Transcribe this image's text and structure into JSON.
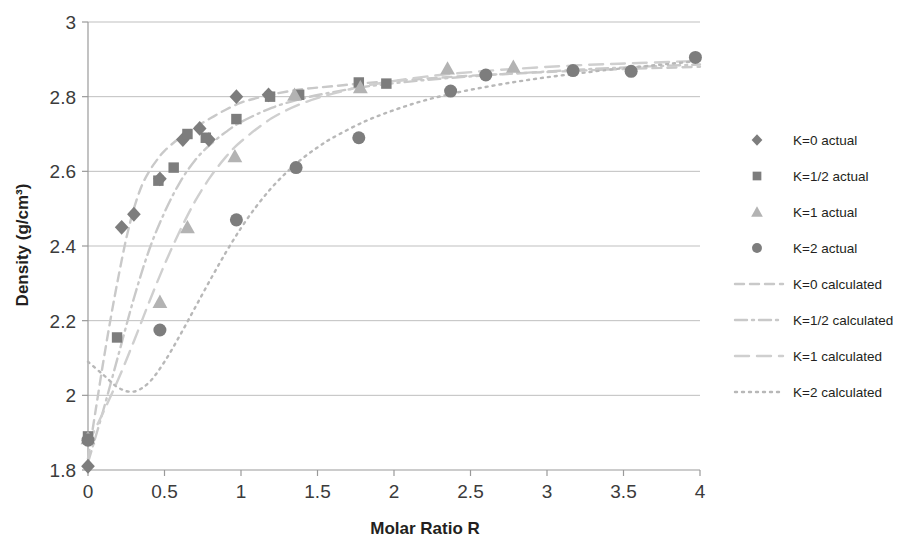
{
  "chart_data": {
    "type": "scatter",
    "title": "",
    "xlabel": "Molar Ratio R",
    "ylabel": "Density (g/cm³)",
    "xlim": [
      0,
      4
    ],
    "ylim": [
      1.8,
      3
    ],
    "xticks": [
      "0",
      "0.5",
      "1",
      "1.5",
      "2",
      "2.5",
      "3",
      "3.5",
      "4"
    ],
    "xtick_values": [
      0,
      0.5,
      1,
      1.5,
      2,
      2.5,
      3,
      3.5,
      4
    ],
    "yticks": [
      "1.8",
      "2",
      "2.2",
      "2.4",
      "2.6",
      "2.8",
      "3"
    ],
    "ytick_values": [
      1.8,
      2.0,
      2.2,
      2.4,
      2.6,
      2.8,
      3.0
    ],
    "grid": "horizontal",
    "legend_position": "right",
    "marker_color": "#7d7d7d",
    "marker_color_light": "#b3b3b3",
    "line_color": "#c9c9c9",
    "axis_color": "#9a9a9a",
    "series": [
      {
        "name": "K=0 actual",
        "marker": "diamond",
        "color": "#7d7d7d",
        "points": [
          [
            0.0,
            1.81
          ],
          [
            0.22,
            2.45
          ],
          [
            0.3,
            2.485
          ],
          [
            0.47,
            2.58
          ],
          [
            0.62,
            2.685
          ],
          [
            0.73,
            2.715
          ],
          [
            0.79,
            2.685
          ],
          [
            0.97,
            2.8
          ],
          [
            1.18,
            2.805
          ]
        ]
      },
      {
        "name": "K=1/2 actual",
        "marker": "square",
        "color": "#7d7d7d",
        "points": [
          [
            0.0,
            1.89
          ],
          [
            0.19,
            2.155
          ],
          [
            0.46,
            2.575
          ],
          [
            0.56,
            2.61
          ],
          [
            0.65,
            2.7
          ],
          [
            0.77,
            2.69
          ],
          [
            0.97,
            2.74
          ],
          [
            1.19,
            2.8
          ],
          [
            1.38,
            2.805
          ],
          [
            1.77,
            2.838
          ],
          [
            1.95,
            2.835
          ]
        ]
      },
      {
        "name": "K=1 actual",
        "marker": "triangle",
        "color": "#b3b3b3",
        "points": [
          [
            0.0,
            1.885
          ],
          [
            0.47,
            2.25
          ],
          [
            0.65,
            2.45
          ],
          [
            0.96,
            2.64
          ],
          [
            1.35,
            2.805
          ],
          [
            1.78,
            2.825
          ],
          [
            2.35,
            2.875
          ],
          [
            2.78,
            2.88
          ]
        ]
      },
      {
        "name": "K=2 actual",
        "marker": "circle",
        "color": "#7d7d7d",
        "points": [
          [
            0.0,
            1.88
          ],
          [
            0.47,
            2.175
          ],
          [
            0.97,
            2.47
          ],
          [
            1.36,
            2.61
          ],
          [
            1.77,
            2.69
          ],
          [
            2.37,
            2.815
          ],
          [
            2.6,
            2.858
          ],
          [
            3.17,
            2.87
          ],
          [
            3.55,
            2.868
          ],
          [
            3.97,
            2.905
          ]
        ]
      }
    ],
    "curves": [
      {
        "name": "K=0 calculated",
        "dash": "dashed",
        "color": "#c9c9c9",
        "points": [
          [
            0.0,
            1.83
          ],
          [
            0.05,
            1.96
          ],
          [
            0.1,
            2.09
          ],
          [
            0.15,
            2.21
          ],
          [
            0.2,
            2.32
          ],
          [
            0.25,
            2.42
          ],
          [
            0.3,
            2.5
          ],
          [
            0.35,
            2.56
          ],
          [
            0.4,
            2.6
          ],
          [
            0.45,
            2.63
          ],
          [
            0.5,
            2.655
          ],
          [
            0.6,
            2.69
          ],
          [
            0.7,
            2.718
          ],
          [
            0.8,
            2.742
          ],
          [
            0.9,
            2.765
          ],
          [
            1.0,
            2.784
          ],
          [
            1.1,
            2.796
          ],
          [
            1.2,
            2.806
          ],
          [
            1.4,
            2.82
          ],
          [
            1.6,
            2.828
          ],
          [
            1.8,
            2.836
          ],
          [
            2.0,
            2.842
          ],
          [
            2.2,
            2.848
          ],
          [
            2.5,
            2.856
          ],
          [
            3.0,
            2.866
          ],
          [
            3.5,
            2.874
          ],
          [
            4.0,
            2.88
          ]
        ]
      },
      {
        "name": "K=1/2 calculated",
        "dash": "dashdot",
        "color": "#c9c9c9",
        "points": [
          [
            0.0,
            1.82
          ],
          [
            0.1,
            1.96
          ],
          [
            0.2,
            2.11
          ],
          [
            0.3,
            2.26
          ],
          [
            0.4,
            2.39
          ],
          [
            0.5,
            2.49
          ],
          [
            0.6,
            2.57
          ],
          [
            0.7,
            2.63
          ],
          [
            0.8,
            2.672
          ],
          [
            0.9,
            2.705
          ],
          [
            1.0,
            2.732
          ],
          [
            1.2,
            2.77
          ],
          [
            1.4,
            2.795
          ],
          [
            1.6,
            2.812
          ],
          [
            1.8,
            2.826
          ],
          [
            2.0,
            2.836
          ],
          [
            2.3,
            2.848
          ],
          [
            2.7,
            2.86
          ],
          [
            3.2,
            2.872
          ],
          [
            3.6,
            2.88
          ],
          [
            4.0,
            2.886
          ]
        ]
      },
      {
        "name": "K=1 calculated",
        "dash": "longdash",
        "color": "#cfcfcf",
        "points": [
          [
            0.0,
            1.87
          ],
          [
            0.1,
            1.955
          ],
          [
            0.2,
            2.045
          ],
          [
            0.3,
            2.145
          ],
          [
            0.4,
            2.25
          ],
          [
            0.5,
            2.35
          ],
          [
            0.6,
            2.44
          ],
          [
            0.7,
            2.52
          ],
          [
            0.8,
            2.585
          ],
          [
            0.9,
            2.638
          ],
          [
            1.0,
            2.68
          ],
          [
            1.2,
            2.742
          ],
          [
            1.4,
            2.782
          ],
          [
            1.6,
            2.808
          ],
          [
            1.8,
            2.828
          ],
          [
            2.0,
            2.842
          ],
          [
            2.3,
            2.858
          ],
          [
            2.7,
            2.872
          ],
          [
            3.2,
            2.884
          ],
          [
            3.6,
            2.89
          ],
          [
            4.0,
            2.896
          ]
        ]
      },
      {
        "name": "K=2 calculated",
        "dash": "dotted",
        "color": "#b8b8b8",
        "points": [
          [
            0.0,
            2.09
          ],
          [
            0.1,
            2.055
          ],
          [
            0.2,
            2.02
          ],
          [
            0.3,
            2.01
          ],
          [
            0.4,
            2.035
          ],
          [
            0.5,
            2.09
          ],
          [
            0.6,
            2.16
          ],
          [
            0.7,
            2.235
          ],
          [
            0.8,
            2.31
          ],
          [
            0.9,
            2.382
          ],
          [
            1.0,
            2.448
          ],
          [
            1.1,
            2.506
          ],
          [
            1.2,
            2.556
          ],
          [
            1.3,
            2.598
          ],
          [
            1.4,
            2.634
          ],
          [
            1.5,
            2.664
          ],
          [
            1.6,
            2.69
          ],
          [
            1.8,
            2.732
          ],
          [
            2.0,
            2.764
          ],
          [
            2.2,
            2.79
          ],
          [
            2.4,
            2.81
          ],
          [
            2.6,
            2.826
          ],
          [
            2.8,
            2.84
          ],
          [
            3.0,
            2.852
          ],
          [
            3.2,
            2.862
          ],
          [
            3.4,
            2.872
          ],
          [
            3.6,
            2.88
          ],
          [
            3.8,
            2.888
          ],
          [
            4.0,
            2.896
          ]
        ]
      }
    ]
  },
  "legend": {
    "items": [
      {
        "label": "K=0 actual",
        "kind": "marker",
        "marker": "diamond",
        "color": "#7d7d7d"
      },
      {
        "label": "K=1/2 actual",
        "kind": "marker",
        "marker": "square",
        "color": "#7d7d7d"
      },
      {
        "label": "K=1 actual",
        "kind": "marker",
        "marker": "triangle",
        "color": "#b3b3b3"
      },
      {
        "label": "K=2 actual",
        "kind": "marker",
        "marker": "circle",
        "color": "#7d7d7d"
      },
      {
        "label": "K=0 calculated",
        "kind": "line",
        "dash": "dashed",
        "color": "#c9c9c9"
      },
      {
        "label": "K=1/2 calculated",
        "kind": "line",
        "dash": "dashdot",
        "color": "#c9c9c9"
      },
      {
        "label": "K=1 calculated",
        "kind": "line",
        "dash": "longdash",
        "color": "#cfcfcf"
      },
      {
        "label": "K=2 calculated",
        "kind": "line",
        "dash": "dotted",
        "color": "#b8b8b8"
      }
    ]
  }
}
